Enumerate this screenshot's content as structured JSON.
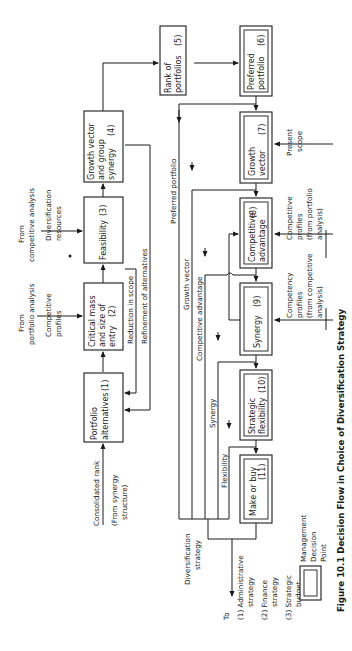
{
  "figure": {
    "caption": "Figure 10.1 Decision Flow in Choice of Diversification Strategy",
    "orientation": "rotated 90° counter-clockwise"
  },
  "boxes": {
    "b1": {
      "label": [
        "Portfolio",
        "alternatives"
      ],
      "num": "(1)",
      "decision_point": false
    },
    "b2": {
      "label": [
        "Critical mass",
        "and size of",
        "entry"
      ],
      "num": "(2)",
      "decision_point": false
    },
    "b3": {
      "label": [
        "Feasibility"
      ],
      "num": "(3)",
      "decision_point": false
    },
    "b4": {
      "label": [
        "Growth vector",
        "and group",
        "synergy"
      ],
      "num": "(4)",
      "decision_point": false
    },
    "b5": {
      "label": [
        "Rank of",
        "portfolios"
      ],
      "num": "(5)",
      "decision_point": false
    },
    "b6": {
      "label": [
        "Preferred",
        "portfolio"
      ],
      "num": "(6)",
      "decision_point": true
    },
    "b7": {
      "label": [
        "Growth",
        "vector"
      ],
      "num": "(7)",
      "decision_point": true
    },
    "b8": {
      "label": [
        "Competitive",
        "advantage"
      ],
      "num": "(8)",
      "decision_point": true
    },
    "b9": {
      "label": [
        "Synergy"
      ],
      "num": "(9)",
      "decision_point": true
    },
    "b10": {
      "label": [
        "Strategic",
        "flexibility"
      ],
      "num": "(10)",
      "decision_point": true
    },
    "b11": {
      "label": [
        "Make or buy"
      ],
      "num": "(11)",
      "decision_point": true
    }
  },
  "inputs": {
    "from_portfolio_analysis": [
      "From",
      "portfolio analysis"
    ],
    "competitive_profiles": [
      "Competitive",
      "profiles"
    ],
    "from_competitive_analysis": [
      "From",
      "competitive analysis"
    ],
    "diversification_resources": [
      "Diversification",
      "resources"
    ],
    "consolidated_rank": "Consolidated rank",
    "from_synergy_structure": [
      "(From synergy",
      "structure)"
    ],
    "present_scope": [
      "Present",
      "scope"
    ],
    "competitive_profiles_portfolio": [
      "Competitive",
      "profiles",
      "(from portfolio",
      "analysis)"
    ],
    "competency_profiles": [
      "Competency",
      "profiles",
      "(from competitive",
      "analysis)"
    ]
  },
  "feedback": {
    "reduction_in_scope": "Reduction in scope",
    "refinement_of_alternatives": "Refinement of alternatives"
  },
  "flow_labels": {
    "preferred_portfolio": "Preferred portfolio",
    "growth_vector": "Growth vector",
    "competitive_advantage": "Competitive advantage",
    "synergy": "Synergy",
    "flexibility": "Flexibility",
    "diversification_strategy": [
      "Diversification",
      "strategy"
    ]
  },
  "outputs": {
    "to": "To",
    "items": [
      [
        "(1) Administrative",
        "strategy"
      ],
      [
        "(2) Finance",
        "strategy"
      ],
      [
        "(3) Strategic",
        "budget"
      ]
    ]
  },
  "legend": {
    "label": [
      "Management",
      "Decision",
      "Point"
    ]
  }
}
